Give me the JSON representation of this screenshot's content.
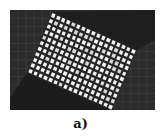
{
  "figure": {
    "caption": "a)",
    "colors": {
      "background_panel": "#2b2b2b",
      "background_grid_line": "#3c3c3c",
      "shadow_region": "#1a1a1a",
      "overlay_cell": "#f4f4f4",
      "overlay_gap": "#262626",
      "page": "#ffffff",
      "caption_text": "#111111"
    },
    "overlay": {
      "rows": 11,
      "cols": 17,
      "rotation_deg": 20
    },
    "background_grid": {
      "rows": 12,
      "cols": 18
    }
  }
}
